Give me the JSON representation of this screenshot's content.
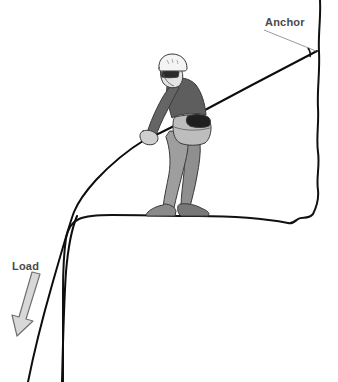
{
  "illustration": {
    "title": "Rope anchor and load over a cliff edge",
    "background_color": "#ffffff",
    "line_color": "#111111",
    "label_color": "#4a4a4a"
  },
  "labels": {
    "anchor": "Anchor",
    "load": "Load"
  },
  "annotations": {
    "anchor_leader_from": "263,30",
    "anchor_leader_to": "316,52",
    "load_arrow_direction": "down-left",
    "load_arrow_fill": "#d6d6d6",
    "load_arrow_stroke": "#707070"
  },
  "figure": {
    "name": "climber",
    "helmet_color": "#f2f2f2",
    "jacket_color": "#5e5e5e",
    "pants_color": "#9e9e9e",
    "boots_color": "#7d7d7d",
    "harness_color": "#b4b4b4",
    "pack_patch_color": "#1a1a1a",
    "skin_color": "#e0e0e0",
    "glasses_color": "#2b2b2b",
    "pose": "standing on ledge, leaning back, both hands gripping rope"
  },
  "terrain": {
    "cliff_wall_side": "right",
    "ledge_y": 216,
    "lip_x": 68,
    "drop_side": "left"
  },
  "ropes": [
    {
      "name": "anchor-rope",
      "from": "anchor point at cliff top right",
      "to": "climber hands"
    },
    {
      "name": "load-rope",
      "from": "climber hands",
      "to": "over cliff lip, down to load below"
    }
  ]
}
